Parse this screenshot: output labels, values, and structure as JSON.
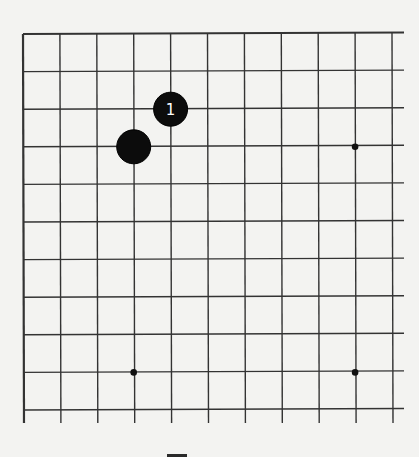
{
  "board": {
    "type": "go-diagram",
    "visible_columns": 11,
    "visible_rows": 11,
    "edges_shown": [
      "top",
      "left"
    ],
    "origin": {
      "x": 23,
      "y": 34
    },
    "spacing": {
      "x": 36.9,
      "y": 37.6
    },
    "line_extend_right_to": 404,
    "line_extend_bottom_to": 423,
    "colors": {
      "paper": "#f3f3f1",
      "line": "#333333",
      "stone_black": "#0c0c0c",
      "stone_label": "#ffffff"
    },
    "stones": [
      {
        "color": "black",
        "col": 4,
        "row": 2,
        "label": "1"
      },
      {
        "color": "black",
        "col": 3,
        "row": 3,
        "label": ""
      }
    ],
    "star_points": [
      {
        "col": 9,
        "row": 3
      },
      {
        "col": 3,
        "row": 9
      },
      {
        "col": 9,
        "row": 9
      }
    ]
  }
}
